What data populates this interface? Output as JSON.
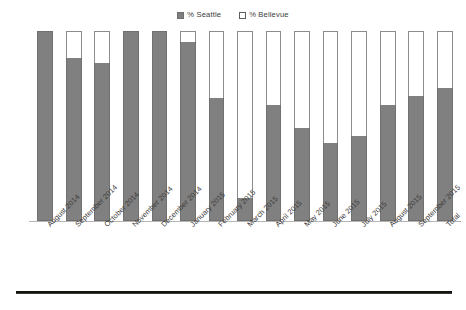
{
  "legend": {
    "position": "top-center",
    "entries": [
      {
        "label": "% Seattle",
        "swatch": "filled-square-icon",
        "color": "#808080"
      },
      {
        "label": "% Bellevue",
        "swatch": "hollow-square-icon",
        "color": "#ffffff"
      }
    ]
  },
  "colors": {
    "seattle": "#808080",
    "bellevue": "#ffffff",
    "bar_outline": "#8c8c8c",
    "axis_line": "#b5b5b5",
    "bottom_rule": "#15130f",
    "text": "#3a3a38"
  },
  "chart_data": {
    "type": "bar",
    "subtype": "stacked-100-percent-column",
    "title": "",
    "subtitle": "",
    "xlabel": "",
    "ylabel": "",
    "ylim": [
      0,
      100
    ],
    "grid": false,
    "legend_position": "top-center",
    "axis_tick_labels": [],
    "categories": [
      "August 2014",
      "September 2014",
      "October 2014",
      "November 2014",
      "December 2014",
      "January 2015",
      "February 2015",
      "March 2015",
      "April 2015",
      "May 2015",
      "June 2015",
      "July 2015",
      "August 2015",
      "September 2015",
      "Total"
    ],
    "series": [
      {
        "name": "% Seattle",
        "color": "#808080",
        "values": [
          100,
          86,
          83,
          100,
          100,
          94,
          65,
          12,
          61,
          49,
          41,
          45,
          61,
          66,
          70
        ]
      },
      {
        "name": "% Bellevue",
        "color": "#ffffff",
        "values": [
          0,
          14,
          17,
          0,
          0,
          6,
          35,
          88,
          39,
          51,
          59,
          55,
          39,
          34,
          30
        ]
      }
    ],
    "annotations": []
  }
}
